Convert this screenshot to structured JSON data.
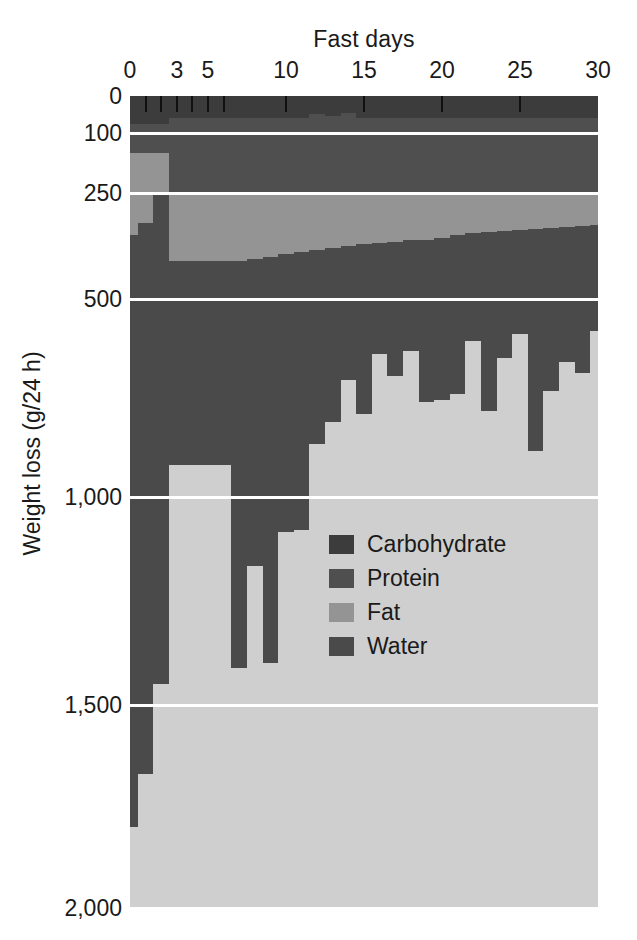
{
  "chart_data": {
    "type": "area",
    "title": "",
    "xlabel": "Fast days",
    "ylabel": "Weight loss (g/24 h)",
    "x": [
      0,
      1,
      2,
      3,
      4,
      5,
      6,
      7,
      8,
      9,
      10,
      11,
      12,
      13,
      14,
      15,
      16,
      17,
      18,
      19,
      20,
      21,
      22,
      23,
      24,
      25,
      26,
      27,
      28,
      29,
      30
    ],
    "xlim": [
      0,
      30
    ],
    "xticks": [
      0,
      3,
      5,
      10,
      15,
      20,
      25,
      30
    ],
    "xtick_labels": [
      "0",
      "3",
      "5",
      "10",
      "15",
      "20",
      "25",
      "30"
    ],
    "xminor_ticks": [
      1,
      2,
      4,
      6
    ],
    "ylim": [
      0,
      2000
    ],
    "yticks": [
      0,
      100,
      250,
      500,
      1000,
      1500,
      2000
    ],
    "ytick_labels": [
      "0",
      "100",
      "250",
      "500",
      "1,000",
      "1,500",
      "2,000"
    ],
    "y_axis_note": "non-linear / expanded scale between 0 and 500",
    "grid": "horizontal white gridlines at each y tick",
    "legend_position": "inside center",
    "stack_order_top_to_bottom": [
      "Carbohydrate",
      "Protein",
      "Fat",
      "Water"
    ],
    "series": [
      {
        "name": "Carbohydrate",
        "color": "#3c3c3c",
        "values": [
          75,
          75,
          75,
          60,
          60,
          60,
          60,
          60,
          60,
          60,
          60,
          60,
          48,
          55,
          45,
          60,
          60,
          60,
          60,
          60,
          60,
          60,
          60,
          60,
          60,
          60,
          60,
          60,
          60,
          60,
          60
        ]
      },
      {
        "name": "Protein",
        "color": "#4f4f4f",
        "values": [
          75,
          75,
          75,
          190,
          190,
          190,
          190,
          190,
          190,
          190,
          190,
          190,
          202,
          195,
          205,
          190,
          190,
          190,
          190,
          190,
          190,
          190,
          190,
          190,
          190,
          190,
          190,
          190,
          190,
          190,
          190
        ]
      },
      {
        "name": "Fat",
        "color": "#949494",
        "values": [
          200,
          170,
          100,
          160,
          160,
          160,
          160,
          160,
          155,
          150,
          145,
          140,
          135,
          130,
          125,
          120,
          118,
          115,
          112,
          110,
          105,
          100,
          95,
          92,
          90,
          88,
          85,
          82,
          80,
          78,
          75
        ]
      },
      {
        "name": "Water",
        "color": "#4a4a4a",
        "values": [
          1450,
          1350,
          1200,
          510,
          510,
          510,
          510,
          1000,
          760,
          1000,
          690,
          690,
          480,
          430,
          330,
          420,
          270,
          330,
          270,
          400,
          400,
          390,
          260,
          440,
          310,
          250,
          550,
          400,
          330,
          360,
          255
        ]
      }
    ],
    "cumulative_bottom_of_water_g": [
      1800,
      1700,
      1550,
      920,
      920,
      920,
      920,
      1410,
      1165,
      1400,
      1085,
      1080,
      865,
      810,
      705,
      790,
      638,
      695,
      632,
      760,
      755,
      740,
      605,
      782,
      650,
      588,
      885,
      732,
      660,
      688,
      580
    ]
  },
  "legend": {
    "items": [
      {
        "label": "Carbohydrate",
        "color": "#3c3c3c"
      },
      {
        "label": "Protein",
        "color": "#4f4f4f"
      },
      {
        "label": "Fat",
        "color": "#949494"
      },
      {
        "label": "Water",
        "color": "#4a4a4a"
      }
    ]
  },
  "style": {
    "background": "#ffffff",
    "plot_background": "#c9c9c9",
    "gridline_color": "#ffffff",
    "tick_color": "#101010",
    "text_color": "#1a1a1a"
  }
}
